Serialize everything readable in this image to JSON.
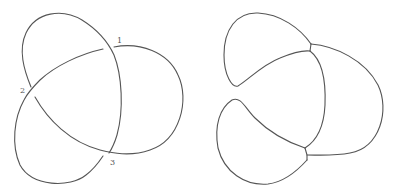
{
  "figure": {
    "stroke_color": "#555555",
    "background": "#ffffff",
    "left_diagram": {
      "name": "trefoil-knot-diagram",
      "crossing_labels": [
        {
          "text": "1",
          "x": 118,
          "y": 42
        },
        {
          "text": "2",
          "x": 20,
          "y": 92
        },
        {
          "text": "3",
          "x": 110,
          "y": 165
        }
      ]
    },
    "right_diagram": {
      "name": "smoothed-trefoil-diagram",
      "junction_count": 2
    }
  }
}
